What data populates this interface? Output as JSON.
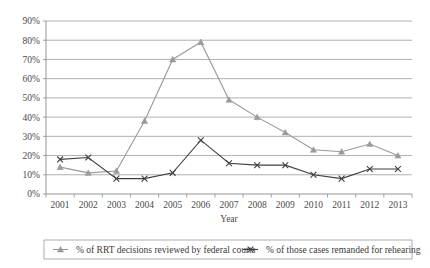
{
  "chart_data": {
    "type": "line",
    "title": "",
    "xlabel": "Year",
    "ylabel": "",
    "categories": [
      "2001",
      "2002",
      "2003",
      "2004",
      "2005",
      "2006",
      "2007",
      "2008",
      "2009",
      "2010",
      "2011",
      "2012",
      "2013"
    ],
    "x": [
      2001,
      2002,
      2003,
      2004,
      2005,
      2006,
      2007,
      2008,
      2009,
      2010,
      2011,
      2012,
      2013
    ],
    "ylim": [
      0,
      90
    ],
    "ytick_labels": [
      "0%",
      "10%",
      "20%",
      "30%",
      "40%",
      "50%",
      "60%",
      "70%",
      "80%",
      "90%"
    ],
    "ytick_values": [
      0,
      10,
      20,
      30,
      40,
      50,
      60,
      70,
      80,
      90
    ],
    "grid": true,
    "legend_position": "bottom",
    "series": [
      {
        "name": "% of RRT decisions reviewed by federal courts",
        "marker": "triangle",
        "color": "#9a9a9a",
        "values": [
          14,
          11,
          12,
          38,
          70,
          79,
          49,
          40,
          32,
          23,
          22,
          26,
          20
        ]
      },
      {
        "name": "% of those cases remanded for rehearing",
        "marker": "x",
        "color": "#3f3f3f",
        "values": [
          18,
          19,
          8,
          8,
          11,
          28,
          16,
          15,
          15,
          10,
          8,
          13,
          13
        ]
      }
    ]
  },
  "axis": {
    "x_title": "Year"
  },
  "legend": {
    "entries": [
      {
        "label": "% of RRT decisions reviewed by federal courts"
      },
      {
        "label": "% of those cases remanded for rehearing"
      }
    ]
  }
}
